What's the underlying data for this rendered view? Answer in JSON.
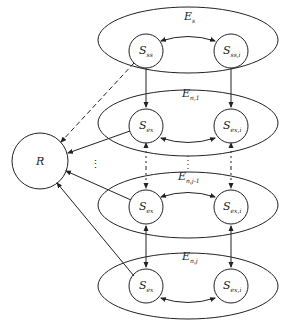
{
  "diagram": {
    "hub": {
      "label": "R"
    },
    "groups": [
      {
        "label": "E",
        "sub": "s",
        "left": {
          "label": "S",
          "sub": "ss"
        },
        "right": {
          "label": "S",
          "sub": "ss,i"
        }
      },
      {
        "label": "E",
        "sub": "n,1",
        "left": {
          "label": "S",
          "sub": "ex"
        },
        "right": {
          "label": "S",
          "sub": "ex,i"
        }
      },
      {
        "label": "E",
        "sub": "n,j-1",
        "left": {
          "label": "S",
          "sub": "ex"
        },
        "right": {
          "label": "S",
          "sub": "ex,i"
        }
      },
      {
        "label": "E",
        "sub": "n,j",
        "left": {
          "label": "S",
          "sub": "ex"
        },
        "right": {
          "label": "S",
          "sub": "ex,i"
        }
      }
    ],
    "ellipsis": "⋮",
    "colors": {
      "stroke": "#222222",
      "background": "#ffffff"
    }
  }
}
